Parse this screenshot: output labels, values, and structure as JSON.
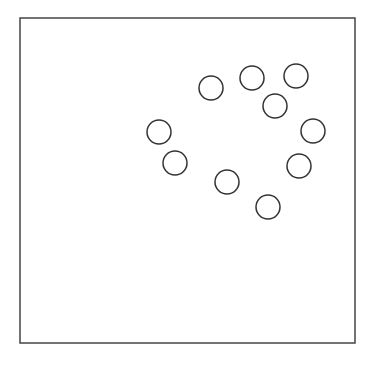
{
  "diagram": {
    "background": "#ffffff",
    "stroke_color": "#333333",
    "frame": {
      "x": 20,
      "y": 18,
      "width": 335,
      "height": 325,
      "stroke_width": 1.5,
      "stroke_color": "#444444"
    },
    "circle_radius": 12,
    "circle_stroke_width": 1.5,
    "circles": [
      {
        "id": 1,
        "cx": 211,
        "cy": 88
      },
      {
        "id": 2,
        "cx": 252,
        "cy": 78
      },
      {
        "id": 3,
        "cx": 296,
        "cy": 76
      },
      {
        "id": 4,
        "cx": 275,
        "cy": 106
      },
      {
        "id": 5,
        "cx": 159,
        "cy": 132
      },
      {
        "id": 6,
        "cx": 175,
        "cy": 163
      },
      {
        "id": 7,
        "cx": 313,
        "cy": 131
      },
      {
        "id": 8,
        "cx": 299,
        "cy": 166
      },
      {
        "id": 9,
        "cx": 227,
        "cy": 182
      },
      {
        "id": 10,
        "cx": 268,
        "cy": 207
      }
    ]
  }
}
